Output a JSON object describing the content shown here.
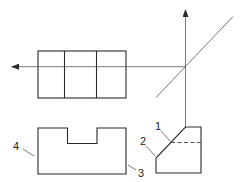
{
  "diagram": {
    "type": "orthographic-projection",
    "colors": {
      "line": "#2a2a2a",
      "background": "#ffffff"
    },
    "views": {
      "top_view": {
        "rect": [
          38,
          51,
          126,
          98
        ],
        "dividers_x": [
          64.5,
          96.5
        ]
      },
      "front_view": {
        "outline": [
          [
            38,
            128
          ],
          [
            67.5,
            128
          ],
          [
            67.5,
            143.5
          ],
          [
            97,
            143.5
          ],
          [
            97,
            128
          ],
          [
            126,
            128
          ],
          [
            126,
            174
          ],
          [
            38,
            174
          ]
        ]
      },
      "side_view": {
        "outline": [
          [
            185.5,
            127
          ],
          [
            201,
            127
          ],
          [
            201,
            173
          ],
          [
            156,
            173
          ],
          [
            156,
            158
          ]
        ],
        "hidden_line_y": 142.5
      }
    },
    "projection_lines": {
      "horizontal_arrow": {
        "from": [
          185.5,
          66.7
        ],
        "to": [
          11,
          66.7
        ]
      },
      "vertical_arrow": {
        "from": [
          185.5,
          127
        ],
        "to": [
          185.5,
          10
        ]
      },
      "miter_line": {
        "from": [
          156,
          97.5
        ],
        "to": [
          233,
          16.5
        ]
      }
    },
    "labels": [
      {
        "text": "1",
        "x": 155,
        "y": 130
      },
      {
        "text": "2",
        "x": 140,
        "y": 145
      },
      {
        "text": "3",
        "x": 138,
        "y": 177
      },
      {
        "text": "4",
        "x": 13,
        "y": 150
      }
    ]
  }
}
